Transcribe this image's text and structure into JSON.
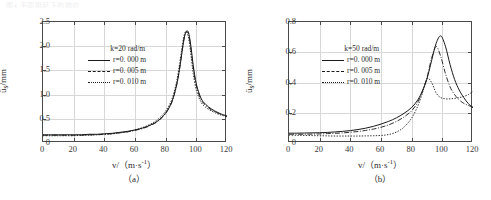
{
  "page": {
    "top_artifact_text": "图4  不同阻尼下的响应"
  },
  "figures": [
    {
      "caption": "（a）",
      "legend": {
        "title": "k=20 rad/m",
        "entries": [
          {
            "label": "r=0. 000 m",
            "style": "solid"
          },
          {
            "label": "r=0. 005 m",
            "style": "dashdot"
          },
          {
            "label": "r=0. 010 m",
            "style": "dotted"
          }
        ]
      },
      "axis": {
        "x_title_pre": "v/（m·s",
        "x_title_sup": "-1",
        "x_title_post": "）",
        "y_title_pre": "ü",
        "y_title_sub": "s",
        "y_title_post": "/mm",
        "x_ticks": [
          "0",
          "20",
          "40",
          "60",
          "80",
          "100",
          "120"
        ],
        "y_ticks": [
          "0",
          "0.5",
          "1.0",
          "1.5",
          "2.0",
          "2.5"
        ]
      },
      "chart_data": {
        "type": "line",
        "title": "",
        "xlabel": "v/(m·s^-1)",
        "ylabel": "u_s/mm",
        "xlim": [
          0,
          120
        ],
        "ylim": [
          0,
          2.5
        ],
        "xticks": [
          0,
          20,
          40,
          60,
          80,
          100,
          120
        ],
        "yticks": [
          0,
          0.5,
          1.0,
          1.5,
          2.0,
          2.5
        ],
        "grid": true,
        "legend_position": "center",
        "annotations": [
          "k=20 rad/m"
        ],
        "x": [
          0,
          5,
          10,
          15,
          20,
          25,
          30,
          35,
          40,
          45,
          50,
          55,
          60,
          65,
          70,
          75,
          80,
          84,
          87,
          89,
          91,
          92,
          93,
          94,
          95,
          96,
          97,
          98,
          100,
          103,
          106,
          110,
          114,
          117,
          120
        ],
        "series": [
          {
            "name": "r=0.000 m",
            "style": "solid",
            "values": [
              0.17,
              0.17,
              0.17,
              0.17,
              0.17,
              0.17,
              0.18,
              0.18,
              0.19,
              0.2,
              0.22,
              0.24,
              0.27,
              0.31,
              0.37,
              0.46,
              0.62,
              0.85,
              1.18,
              1.52,
              1.95,
              2.15,
              2.28,
              2.32,
              2.27,
              2.1,
              1.86,
              1.6,
              1.22,
              0.93,
              0.8,
              0.7,
              0.63,
              0.59,
              0.56
            ]
          },
          {
            "name": "r=0.005 m",
            "style": "dashdot",
            "values": [
              0.16,
              0.16,
              0.16,
              0.16,
              0.16,
              0.16,
              0.17,
              0.17,
              0.18,
              0.19,
              0.21,
              0.23,
              0.26,
              0.3,
              0.36,
              0.45,
              0.61,
              0.84,
              1.17,
              1.52,
              1.96,
              2.16,
              2.27,
              2.3,
              2.24,
              2.06,
              1.81,
              1.55,
              1.18,
              0.9,
              0.78,
              0.68,
              0.62,
              0.58,
              0.55
            ]
          },
          {
            "name": "r=0.010 m",
            "style": "dotted",
            "values": [
              0.15,
              0.15,
              0.15,
              0.15,
              0.15,
              0.16,
              0.16,
              0.17,
              0.18,
              0.19,
              0.21,
              0.23,
              0.27,
              0.32,
              0.39,
              0.49,
              0.66,
              0.9,
              1.25,
              1.62,
              2.05,
              2.22,
              2.3,
              2.28,
              2.16,
              1.94,
              1.68,
              1.43,
              1.09,
              0.85,
              0.74,
              0.66,
              0.6,
              0.57,
              0.54
            ]
          }
        ]
      }
    },
    {
      "caption": "（b）",
      "legend": {
        "title": "k=50 rad/m",
        "entries": [
          {
            "label": "r=0. 000 m",
            "style": "solid"
          },
          {
            "label": "r=0. 005 m",
            "style": "dashdot"
          },
          {
            "label": "r=0. 010 m",
            "style": "dotted"
          }
        ]
      },
      "axis": {
        "x_title_pre": "v/（m·s",
        "x_title_sup": "-1",
        "x_title_post": "）",
        "y_title_pre": "ü",
        "y_title_sub": "s",
        "y_title_post": "/mm",
        "x_ticks": [
          "0",
          "20",
          "40",
          "60",
          "80",
          "100",
          "120"
        ],
        "y_ticks": [
          "0",
          "0.2",
          "0.4",
          "0.6",
          "0.8"
        ]
      },
      "chart_data": {
        "type": "line",
        "title": "",
        "xlabel": "v/(m·s^-1)",
        "ylabel": "u_s/mm",
        "xlim": [
          0,
          120
        ],
        "ylim": [
          0,
          0.8
        ],
        "xticks": [
          0,
          20,
          40,
          60,
          80,
          100,
          120
        ],
        "yticks": [
          0,
          0.2,
          0.4,
          0.6,
          0.8
        ],
        "grid": true,
        "legend_position": "center",
        "annotations": [
          "k=50 rad/m"
        ],
        "x": [
          0,
          5,
          10,
          15,
          20,
          25,
          30,
          35,
          40,
          45,
          50,
          55,
          60,
          65,
          70,
          75,
          80,
          84,
          87,
          90,
          93,
          96,
          99,
          102,
          105,
          108,
          111,
          114,
          117,
          120
        ],
        "series": [
          {
            "name": "r=0.000 m",
            "style": "solid",
            "values": [
              0.065,
              0.065,
              0.066,
              0.067,
              0.068,
              0.07,
              0.073,
              0.077,
              0.082,
              0.089,
              0.098,
              0.11,
              0.125,
              0.143,
              0.166,
              0.196,
              0.235,
              0.285,
              0.345,
              0.425,
              0.545,
              0.66,
              0.708,
              0.64,
              0.52,
              0.42,
              0.35,
              0.3,
              0.26,
              0.232
            ]
          },
          {
            "name": "r=0.005 m",
            "style": "dashdot",
            "values": [
              0.058,
              0.058,
              0.058,
              0.059,
              0.06,
              0.062,
              0.064,
              0.067,
              0.071,
              0.076,
              0.083,
              0.092,
              0.104,
              0.12,
              0.142,
              0.172,
              0.213,
              0.27,
              0.34,
              0.432,
              0.56,
              0.638,
              0.57,
              0.46,
              0.372,
              0.32,
              0.285,
              0.262,
              0.248,
              0.238
            ]
          },
          {
            "name": "r=0.010 m",
            "style": "dotted",
            "values": [
              0.052,
              0.051,
              0.05,
              0.049,
              0.048,
              0.047,
              0.046,
              0.046,
              0.046,
              0.046,
              0.047,
              0.048,
              0.05,
              0.056,
              0.072,
              0.105,
              0.165,
              0.245,
              0.33,
              0.425,
              0.4,
              0.33,
              0.3,
              0.292,
              0.292,
              0.295,
              0.3,
              0.308,
              0.32,
              0.342
            ]
          }
        ]
      }
    }
  ]
}
